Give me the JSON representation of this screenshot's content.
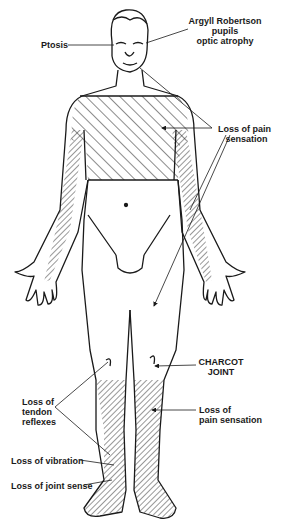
{
  "diagram": {
    "type": "anatomical-figure",
    "colors": {
      "line": "#1a1a1a",
      "background": "#ffffff",
      "hatch": "#1a1a1a"
    },
    "labels": {
      "ptosis": "Ptosis",
      "argyll": "Argyll Robertson\npupils\noptic atrophy",
      "pain_upper": "Loss of pain\n   sensation",
      "charcot": "CHARCOT\nJOINT",
      "tendon": "Loss of\ntendon\nreflexes",
      "pain_lower": "Loss of\npain sensation",
      "vibration": "Loss of vibration",
      "joint_sense": "Loss of joint sense"
    },
    "hatched_regions": [
      "upper-trunk",
      "inner-arms",
      "lower-legs-and-feet"
    ]
  }
}
